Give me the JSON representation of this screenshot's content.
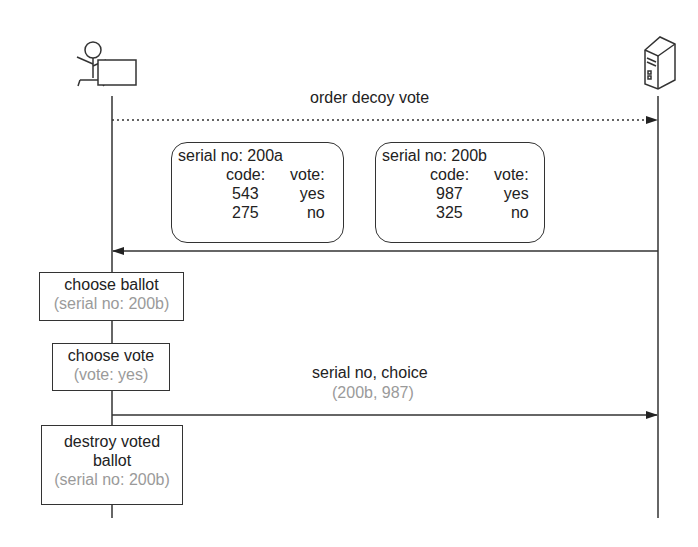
{
  "diagram": {
    "type": "sequence",
    "actors": [
      {
        "id": "voter",
        "icon": "person-at-computer-icon",
        "role": "voter"
      },
      {
        "id": "server",
        "icon": "server-icon",
        "role": "server"
      }
    ],
    "messages": [
      {
        "label": "order decoy vote",
        "from": "voter",
        "to": "server",
        "style": "dotted"
      },
      {
        "label": "",
        "from": "server",
        "to": "voter",
        "style": "solid"
      },
      {
        "label": "serial no, choice",
        "sublabel": "(200b, 987)",
        "from": "voter",
        "to": "server",
        "style": "solid"
      }
    ],
    "ballots": [
      {
        "serial": "serial no: 200a",
        "header": {
          "code": "code:",
          "vote": "vote:"
        },
        "rows": [
          {
            "code": "543",
            "vote": "yes"
          },
          {
            "code": "275",
            "vote": "no"
          }
        ]
      },
      {
        "serial": "serial no: 200b",
        "header": {
          "code": "code:",
          "vote": "vote:"
        },
        "rows": [
          {
            "code": "987",
            "vote": "yes"
          },
          {
            "code": "325",
            "vote": "no"
          }
        ]
      }
    ],
    "actions": [
      {
        "title": "choose ballot",
        "sub": "(serial no: 200b)"
      },
      {
        "title": "choose vote",
        "sub": "(vote: yes)"
      },
      {
        "title_line1": "destroy voted",
        "title_line2": "ballot",
        "sub": "(serial no: 200b)"
      }
    ]
  },
  "colors": {
    "line": "#333333",
    "subtext": "#9a9a9a"
  }
}
